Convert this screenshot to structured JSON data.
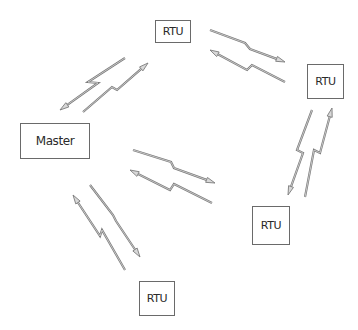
{
  "diagram": {
    "title": "",
    "nodes": [
      {
        "id": "master",
        "label": "Master",
        "x": 20,
        "y": 123,
        "w": 70,
        "h": 36
      },
      {
        "id": "rtu_top",
        "label": "RTU",
        "x": 155,
        "y": 20,
        "w": 36,
        "h": 23
      },
      {
        "id": "rtu_right",
        "label": "RTU",
        "x": 307,
        "y": 64,
        "w": 37,
        "h": 35
      },
      {
        "id": "rtu_bottom_right",
        "label": "RTU",
        "x": 252,
        "y": 206,
        "w": 38,
        "h": 39
      },
      {
        "id": "rtu_bottom",
        "label": "RTU",
        "x": 139,
        "y": 281,
        "w": 36,
        "h": 35
      }
    ],
    "links": [
      {
        "from": "master",
        "to": "rtu_top",
        "bolts": [
          {
            "tail": [
              125,
              58
            ],
            "tip": [
              60,
              110
            ],
            "zig": [
              [
                88,
                82
              ],
              [
                98,
                83
              ]
            ]
          },
          {
            "tail": [
              83,
              112
            ],
            "tip": [
              148,
              63
            ],
            "zig": [
              [
                112,
                87
              ],
              [
                117,
                90
              ]
            ]
          }
        ]
      },
      {
        "from": "rtu_top",
        "to": "rtu_right",
        "bolts": [
          {
            "tail": [
              210,
              30
            ],
            "tip": [
              285,
              62
            ],
            "zig": [
              [
                245,
                43
              ],
              [
                250,
                49
              ]
            ]
          },
          {
            "tail": [
              285,
              82
            ],
            "tip": [
              210,
              50
            ],
            "zig": [
              [
                252,
                65
              ],
              [
                247,
                70
              ]
            ]
          }
        ]
      },
      {
        "from": "rtu_right",
        "to": "rtu_bottom_right",
        "bolts": [
          {
            "tail": [
              312,
              110
            ],
            "tip": [
              288,
              195
            ],
            "zig": [
              [
                297,
                150
              ],
              [
                303,
                153
              ]
            ]
          },
          {
            "tail": [
              305,
              197
            ],
            "tip": [
              332,
              108
            ],
            "zig": [
              [
                314,
                150
              ],
              [
                320,
                153
              ]
            ]
          }
        ]
      },
      {
        "from": "master",
        "to": "rtu_bottom_right",
        "bolts": [
          {
            "tail": [
              133,
              150
            ],
            "tip": [
              215,
              183
            ],
            "zig": [
              [
                171,
                162
              ],
              [
                174,
                168
              ]
            ]
          },
          {
            "tail": [
              212,
              203
            ],
            "tip": [
              130,
              170
            ],
            "zig": [
              [
                174,
                184
              ],
              [
                170,
                190
              ]
            ]
          }
        ]
      },
      {
        "from": "master",
        "to": "rtu_bottom",
        "bolts": [
          {
            "tail": [
              125,
              270
            ],
            "tip": [
              73,
              195
            ],
            "zig": [
              [
                102,
                230
              ],
              [
                100,
                236
              ]
            ]
          },
          {
            "tail": [
              90,
              185
            ],
            "tip": [
              140,
              257
            ],
            "zig": [
              [
                113,
                215
              ],
              [
                116,
                221
              ]
            ]
          }
        ]
      }
    ],
    "colors": {
      "bolt_stroke": "#7a7a7a",
      "bolt_fill": "#d8d8d8",
      "node_border": "#6a6a6a"
    }
  }
}
